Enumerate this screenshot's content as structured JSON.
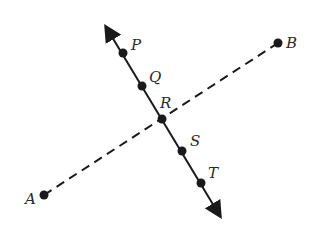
{
  "diagram": {
    "type": "geometry-lines",
    "line_solid": {
      "name": "line through P, Q, R, S, T",
      "start": [
        106,
        27
      ],
      "end": [
        220,
        216
      ],
      "arrows": "both"
    },
    "segment_dashed": {
      "name": "segment AB",
      "start": [
        44,
        195
      ],
      "end": [
        278,
        43
      ]
    },
    "points": [
      {
        "label": "P",
        "x": 123,
        "y": 53,
        "lx": 131,
        "ly": 50
      },
      {
        "label": "Q",
        "x": 142,
        "y": 86,
        "lx": 149,
        "ly": 82
      },
      {
        "label": "R",
        "x": 162,
        "y": 119,
        "lx": 160,
        "ly": 108
      },
      {
        "label": "S",
        "x": 182,
        "y": 151,
        "lx": 190,
        "ly": 146
      },
      {
        "label": "T",
        "x": 201,
        "y": 183,
        "lx": 208,
        "ly": 178
      },
      {
        "label": "A",
        "x": 44,
        "y": 195,
        "lx": 25,
        "ly": 204
      },
      {
        "label": "B",
        "x": 278,
        "y": 43,
        "lx": 286,
        "ly": 48
      }
    ],
    "colors": {
      "stroke": "#1a1a1a",
      "label": "#2a2a2a"
    }
  }
}
